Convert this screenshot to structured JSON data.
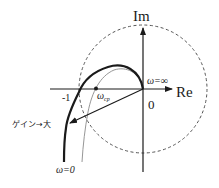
{
  "diagram": {
    "type": "nyquist-plot",
    "axes": {
      "imag_label": "Im",
      "real_label": "Re",
      "origin_label": "0",
      "minus_one_label": "-1"
    },
    "labels": {
      "omega_infinity": "ω=∞",
      "omega_zero": "ω=0",
      "omega_cp": "ω",
      "omega_cp_sub": "cp",
      "gain_increase": "ゲイン→大"
    },
    "colors": {
      "line": "#1a1a1a",
      "thin_curve": "#8a8a8a",
      "dashed_circle": "#555555",
      "background": "#ffffff"
    },
    "elements": [
      "unit circle (dashed) centered at origin",
      "thick Nyquist curve (higher gain)",
      "thin Nyquist curve (lower gain)",
      "arrow from origin indicating gain increase",
      "gain crossover point ω_cp on real axis"
    ]
  }
}
